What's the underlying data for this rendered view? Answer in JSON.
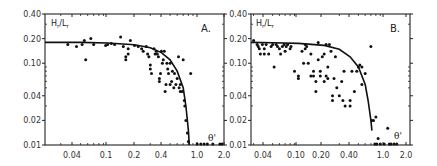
{
  "chart_data": [
    {
      "type": "scatter",
      "panel_label": "A.",
      "ylabel": "Hr/Lr",
      "xlabel": "θ'",
      "xscale": "log",
      "yscale": "log",
      "xlim": [
        0.02,
        2.0
      ],
      "ylim": [
        0.01,
        0.4
      ],
      "x_ticks": [
        "0.04",
        "0.1",
        "0.2",
        "0.4",
        "1.0",
        "2.0"
      ],
      "y_ticks": [
        "0.40",
        "0.20",
        "0.10",
        "0.04",
        "0.02",
        "0.01"
      ],
      "grid": false,
      "series": [
        {
          "name": "observations",
          "points": [
            [
              0.036,
              0.17
            ],
            [
              0.045,
              0.16
            ],
            [
              0.052,
              0.17
            ],
            [
              0.055,
              0.19
            ],
            [
              0.057,
              0.11
            ],
            [
              0.065,
              0.2
            ],
            [
              0.07,
              0.17
            ],
            [
              0.095,
              0.165
            ],
            [
              0.1,
              0.17
            ],
            [
              0.11,
              0.175
            ],
            [
              0.12,
              0.17
            ],
            [
              0.14,
              0.21
            ],
            [
              0.15,
              0.16
            ],
            [
              0.16,
              0.12
            ],
            [
              0.16,
              0.11
            ],
            [
              0.17,
              0.13
            ],
            [
              0.17,
              0.15
            ],
            [
              0.18,
              0.19
            ],
            [
              0.2,
              0.165
            ],
            [
              0.22,
              0.16
            ],
            [
              0.24,
              0.15
            ],
            [
              0.25,
              0.14
            ],
            [
              0.27,
              0.16
            ],
            [
              0.28,
              0.13
            ],
            [
              0.29,
              0.12
            ],
            [
              0.3,
              0.095
            ],
            [
              0.3,
              0.085
            ],
            [
              0.31,
              0.075
            ],
            [
              0.33,
              0.15
            ],
            [
              0.34,
              0.13
            ],
            [
              0.35,
              0.14
            ],
            [
              0.36,
              0.13
            ],
            [
              0.37,
              0.12
            ],
            [
              0.38,
              0.06
            ],
            [
              0.38,
              0.065
            ],
            [
              0.39,
              0.075
            ],
            [
              0.4,
              0.14
            ],
            [
              0.41,
              0.1
            ],
            [
              0.42,
              0.11
            ],
            [
              0.43,
              0.14
            ],
            [
              0.44,
              0.045
            ],
            [
              0.45,
              0.055
            ],
            [
              0.46,
              0.1
            ],
            [
              0.47,
              0.085
            ],
            [
              0.48,
              0.075
            ],
            [
              0.5,
              0.1
            ],
            [
              0.5,
              0.055
            ],
            [
              0.52,
              0.06
            ],
            [
              0.53,
              0.08
            ],
            [
              0.55,
              0.05
            ],
            [
              0.56,
              0.075
            ],
            [
              0.58,
              0.055
            ],
            [
              0.6,
              0.065
            ],
            [
              0.62,
              0.12
            ],
            [
              0.63,
              0.05
            ],
            [
              0.65,
              0.045
            ],
            [
              0.65,
              0.055
            ],
            [
              0.68,
              0.045
            ],
            [
              0.7,
              0.11
            ],
            [
              0.72,
              0.035
            ],
            [
              0.73,
              0.03
            ],
            [
              0.75,
              0.02
            ],
            [
              0.78,
              0.014
            ],
            [
              0.8,
              0.011
            ],
            [
              0.85,
              0.075
            ],
            [
              1.0,
              0.01
            ],
            [
              1.1,
              0.01
            ],
            [
              1.2,
              0.01
            ],
            [
              1.3,
              0.01
            ],
            [
              1.5,
              0.01
            ],
            [
              1.8,
              0.01
            ],
            [
              1.9,
              0.01
            ]
          ]
        },
        {
          "name": "fitted curve",
          "curve": [
            [
              0.02,
              0.18
            ],
            [
              0.05,
              0.18
            ],
            [
              0.1,
              0.177
            ],
            [
              0.2,
              0.168
            ],
            [
              0.3,
              0.155
            ],
            [
              0.4,
              0.135
            ],
            [
              0.5,
              0.11
            ],
            [
              0.6,
              0.08
            ],
            [
              0.7,
              0.05
            ],
            [
              0.75,
              0.03
            ],
            [
              0.8,
              0.015
            ],
            [
              0.82,
              0.01
            ]
          ]
        }
      ]
    },
    {
      "type": "scatter",
      "panel_label": "B.",
      "ylabel": "Hr/Lr",
      "xlabel": "θ'",
      "xscale": "log",
      "yscale": "log",
      "xlim": [
        0.028,
        2.0
      ],
      "ylim": [
        0.01,
        0.4
      ],
      "x_ticks": [
        "0.04",
        "0.10",
        "0.20",
        "0.40",
        "1.0",
        "2.0"
      ],
      "y_ticks": [
        "0.40",
        "0.20",
        "0.10",
        "0.04",
        "0.02",
        "0.01"
      ],
      "grid": false,
      "series": [
        {
          "name": "observations",
          "points": [
            [
              0.03,
              0.19
            ],
            [
              0.033,
              0.17
            ],
            [
              0.034,
              0.16
            ],
            [
              0.035,
              0.15
            ],
            [
              0.036,
              0.13
            ],
            [
              0.038,
              0.17
            ],
            [
              0.04,
              0.15
            ],
            [
              0.04,
              0.13
            ],
            [
              0.042,
              0.17
            ],
            [
              0.045,
              0.13
            ],
            [
              0.048,
              0.16
            ],
            [
              0.05,
              0.17
            ],
            [
              0.052,
              0.09
            ],
            [
              0.055,
              0.17
            ],
            [
              0.057,
              0.16
            ],
            [
              0.06,
              0.15
            ],
            [
              0.062,
              0.13
            ],
            [
              0.065,
              0.16
            ],
            [
              0.068,
              0.17
            ],
            [
              0.07,
              0.14
            ],
            [
              0.072,
              0.16
            ],
            [
              0.075,
              0.17
            ],
            [
              0.08,
              0.15
            ],
            [
              0.082,
              0.16
            ],
            [
              0.09,
              0.08
            ],
            [
              0.1,
              0.065
            ],
            [
              0.1,
              0.07
            ],
            [
              0.11,
              0.14
            ],
            [
              0.115,
              0.1
            ],
            [
              0.12,
              0.17
            ],
            [
              0.12,
              0.15
            ],
            [
              0.125,
              0.16
            ],
            [
              0.13,
              0.1
            ],
            [
              0.14,
              0.13
            ],
            [
              0.14,
              0.07
            ],
            [
              0.15,
              0.08
            ],
            [
              0.15,
              0.07
            ],
            [
              0.16,
              0.06
            ],
            [
              0.16,
              0.045
            ],
            [
              0.17,
              0.18
            ],
            [
              0.17,
              0.11
            ],
            [
              0.18,
              0.07
            ],
            [
              0.18,
              0.08
            ],
            [
              0.19,
              0.12
            ],
            [
              0.2,
              0.13
            ],
            [
              0.2,
              0.06
            ],
            [
              0.21,
              0.17
            ],
            [
              0.21,
              0.07
            ],
            [
              0.22,
              0.09
            ],
            [
              0.22,
              0.065
            ],
            [
              0.23,
              0.17
            ],
            [
              0.24,
              0.14
            ],
            [
              0.25,
              0.04
            ],
            [
              0.25,
              0.035
            ],
            [
              0.26,
              0.065
            ],
            [
              0.27,
              0.12
            ],
            [
              0.28,
              0.05
            ],
            [
              0.3,
              0.04
            ],
            [
              0.32,
              0.06
            ],
            [
              0.33,
              0.035
            ],
            [
              0.34,
              0.08
            ],
            [
              0.35,
              0.03
            ],
            [
              0.4,
              0.035
            ],
            [
              0.4,
              0.03
            ],
            [
              0.42,
              0.08
            ],
            [
              0.45,
              0.045
            ],
            [
              0.48,
              0.08
            ],
            [
              0.5,
              0.09
            ],
            [
              0.52,
              0.095
            ],
            [
              0.55,
              0.055
            ],
            [
              0.55,
              0.09
            ],
            [
              0.6,
              0.075
            ],
            [
              0.7,
              0.16
            ],
            [
              0.72,
              0.02
            ],
            [
              0.75,
              0.02
            ],
            [
              0.78,
              0.01
            ],
            [
              0.8,
              0.022
            ],
            [
              0.85,
              0.012
            ],
            [
              0.82,
              0.01
            ],
            [
              0.9,
              0.01
            ],
            [
              1.0,
              0.01
            ],
            [
              1.1,
              0.016
            ],
            [
              1.15,
              0.01
            ],
            [
              1.2,
              0.01
            ],
            [
              1.3,
              0.01
            ],
            [
              1.4,
              0.01
            ]
          ]
        },
        {
          "name": "fitted curve",
          "curve": [
            [
              0.028,
              0.18
            ],
            [
              0.05,
              0.178
            ],
            [
              0.1,
              0.175
            ],
            [
              0.2,
              0.165
            ],
            [
              0.3,
              0.148
            ],
            [
              0.4,
              0.12
            ],
            [
              0.5,
              0.09
            ],
            [
              0.6,
              0.055
            ],
            [
              0.65,
              0.035
            ],
            [
              0.7,
              0.02
            ],
            [
              0.72,
              0.015
            ]
          ]
        }
      ]
    }
  ],
  "panels": {
    "a": {
      "label": "A.",
      "ylabel_main": "H",
      "ylabel_sub1": "r",
      "ylabel_sep": "/L",
      "ylabel_sub2": "r",
      "xlabel": "θ'"
    },
    "b": {
      "label": "B.",
      "ylabel_main": "H",
      "ylabel_sub1": "r",
      "ylabel_sep": "/L",
      "ylabel_sub2": "r",
      "xlabel": "θ'"
    }
  }
}
